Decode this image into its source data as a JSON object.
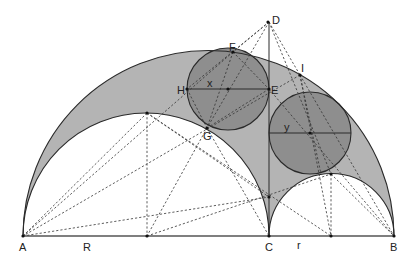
{
  "figure": {
    "type": "arbelos-twin-circles-construction",
    "colors": {
      "background": "#ffffff",
      "arbelos_fill": "#b4b4b4",
      "circle_fill": "#8e8e8e",
      "stroke": "#2a2a2a"
    },
    "labels": {
      "A": "A",
      "B": "B",
      "C": "C",
      "D": "D",
      "E": "E",
      "F": "F",
      "G": "G",
      "H": "H",
      "I": "I",
      "x": "x",
      "y": "y",
      "R": "R",
      "r": "r"
    }
  }
}
